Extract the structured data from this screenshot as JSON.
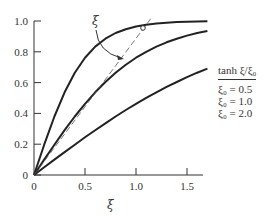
{
  "chart_data": {
    "type": "line",
    "title": "",
    "xlabel": "ξ",
    "ylabel": "",
    "xlim": [
      0,
      1.7
    ],
    "ylim": [
      0,
      1.0
    ],
    "grid": false,
    "x_ticks": [
      "0",
      "0.5",
      "1.0",
      "1.5"
    ],
    "y_ticks": [
      "0",
      "0.2",
      "0.4",
      "0.6",
      "0.8",
      "1.0"
    ],
    "legend_title": "tanh ξ/ξ₀",
    "legend_position": "right",
    "x": [
      0,
      0.1,
      0.2,
      0.3,
      0.4,
      0.5,
      0.6,
      0.7,
      0.8,
      0.9,
      1.0,
      1.1,
      1.2,
      1.3,
      1.4,
      1.5,
      1.6,
      1.7
    ],
    "series": [
      {
        "name": "ξ₀ = 0.5",
        "values": [
          0,
          0.197,
          0.38,
          0.537,
          0.664,
          0.762,
          0.834,
          0.885,
          0.922,
          0.947,
          0.964,
          0.976,
          0.984,
          0.989,
          0.993,
          0.995,
          0.997,
          0.998
        ]
      },
      {
        "name": "ξ₀ = 1.0",
        "values": [
          0,
          0.1,
          0.197,
          0.291,
          0.38,
          0.462,
          0.537,
          0.604,
          0.664,
          0.716,
          0.762,
          0.8,
          0.834,
          0.862,
          0.885,
          0.905,
          0.922,
          0.935
        ]
      },
      {
        "name": "ξ₀ = 2.0",
        "values": [
          0,
          0.05,
          0.1,
          0.149,
          0.197,
          0.245,
          0.291,
          0.336,
          0.38,
          0.422,
          0.462,
          0.501,
          0.537,
          0.572,
          0.604,
          0.635,
          0.664,
          0.691
        ]
      }
    ],
    "annotations": [
      {
        "type": "dashed-line",
        "description": "tangent line y = ξ",
        "from": [
          0,
          0
        ],
        "to": [
          1.15,
          1.03
        ]
      },
      {
        "type": "label-arrow",
        "text": "ξ",
        "points_to": "dashed line near ξ≈0.88, y≈0.78"
      },
      {
        "type": "open-circle",
        "at": [
          1.07,
          0.96
        ]
      }
    ]
  },
  "legend": {
    "title": "tanh ξ/ξ₀",
    "entries": [
      "ξ₀ = 0.5",
      "ξ₀ = 1.0",
      "ξ₀ = 2.0"
    ]
  },
  "annotation_label": "ξ"
}
